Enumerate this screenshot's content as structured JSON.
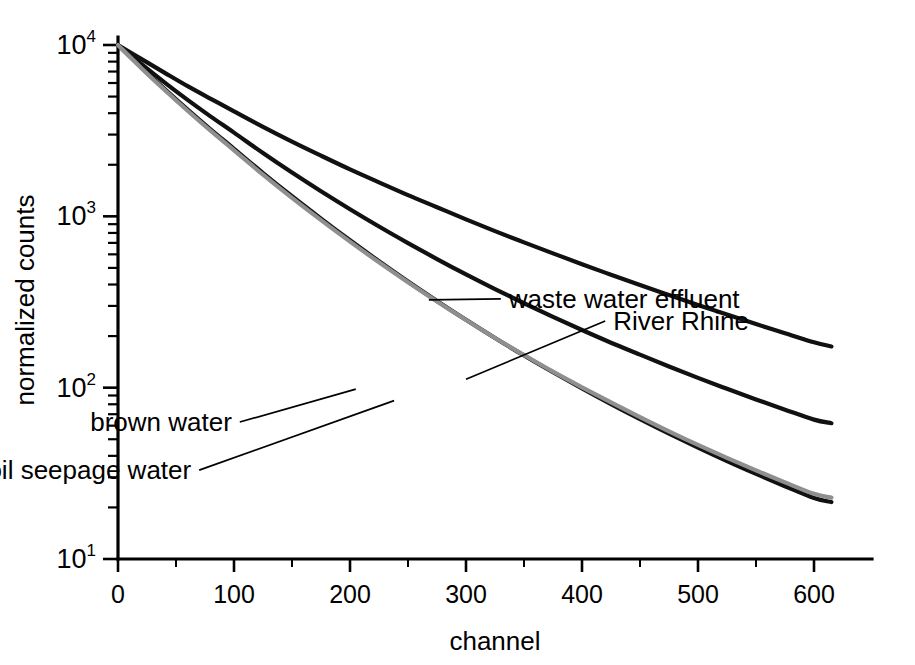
{
  "chart_data": {
    "type": "line",
    "title": "",
    "xlabel": "channel",
    "ylabel": "normalized counts",
    "xlim": [
      0,
      650
    ],
    "ylim": [
      10,
      10000
    ],
    "yscale": "log",
    "xscale": "linear",
    "grid": false,
    "legend_position": "inline-annotations",
    "x_ticks": [
      0,
      100,
      200,
      300,
      400,
      500,
      600
    ],
    "x_tick_labels": [
      "0",
      "100",
      "200",
      "300",
      "400",
      "500",
      "600"
    ],
    "x_minor_step": 50,
    "y_ticks": [
      10,
      100,
      1000,
      10000
    ],
    "y_tick_labels": [
      "10",
      "10",
      "10",
      "10"
    ],
    "y_tick_exponents": [
      "1",
      "2",
      "3",
      "4"
    ],
    "y_minor": "log decades 2-9",
    "x": [
      0,
      20,
      40,
      60,
      80,
      100,
      125,
      150,
      175,
      200,
      225,
      250,
      275,
      300,
      325,
      350,
      375,
      400,
      425,
      450,
      475,
      500,
      525,
      550,
      575,
      600,
      615
    ],
    "series": [
      {
        "name": "waste water effluent",
        "color": "#111111",
        "width": 4.2,
        "label_x": 330,
        "label_y": 330,
        "anchor_x": 268,
        "anchor_y": 325,
        "values": [
          10000,
          8300,
          6900,
          5750,
          4850,
          4100,
          3330,
          2730,
          2260,
          1880,
          1580,
          1330,
          1130,
          960,
          820,
          705,
          608,
          525,
          456,
          397,
          347,
          304,
          267,
          235,
          208,
          184,
          174
        ]
      },
      {
        "name": "River Rhine",
        "color": "#111111",
        "width": 4.2,
        "label_x": 420,
        "label_y": 245,
        "anchor_x": 300,
        "anchor_y": 112,
        "values": [
          10000,
          7750,
          6050,
          4780,
          3820,
          3080,
          2340,
          1800,
          1400,
          1100,
          872,
          698,
          563,
          458,
          376,
          311,
          259,
          217,
          183,
          156,
          133,
          114,
          98.5,
          85.4,
          74.4,
          65.1,
          62.0
        ]
      },
      {
        "name": "brown water",
        "color": "#111111",
        "width": 4.2,
        "label_x": 105,
        "label_y": 63,
        "anchor_x": 205,
        "anchor_y": 98,
        "values": [
          10000,
          7400,
          5550,
          4200,
          3210,
          2480,
          1790,
          1310,
          970,
          725,
          547,
          417,
          321,
          249,
          195,
          154,
          123,
          99.0,
          80.2,
          65.5,
          53.9,
          44.7,
          37.3,
          31.4,
          26.6,
          22.7,
          21.5
        ]
      },
      {
        "name": "soil seepage water",
        "color": "#8f8f8f",
        "width": 4.2,
        "label_x": 70,
        "label_y": 33,
        "anchor_x": 238,
        "anchor_y": 84,
        "values": [
          10000,
          7350,
          5480,
          4130,
          3150,
          2430,
          1750,
          1280,
          950,
          712,
          539,
          412,
          318,
          248,
          195,
          155,
          124,
          100.5,
          82.0,
          67.3,
          55.6,
          46.3,
          38.9,
          32.9,
          28.0,
          24.0,
          22.8
        ]
      }
    ]
  }
}
